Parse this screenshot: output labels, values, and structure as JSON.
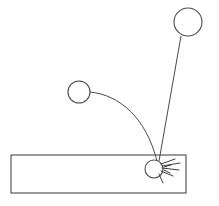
{
  "figure": {
    "background_color": "#ffffff",
    "stroke_color": "#4a4a4a",
    "width": 219,
    "height": 206
  },
  "surface": {
    "label": "surface-bar",
    "x": 11,
    "y": 155,
    "width": 175,
    "height": 38,
    "stroke_color": "#4a4a4a",
    "fill_color": "#ffffff"
  },
  "bodies": [
    {
      "id": "upper-right-circle",
      "label": "large-projectile",
      "cx": 188,
      "cy": 22,
      "r": 14,
      "stroke_color": "#4a4a4a",
      "fill_color": "#ffffff"
    },
    {
      "id": "mid-left-circle",
      "label": "small-projectile",
      "cx": 79,
      "cy": 92,
      "r": 11,
      "stroke_color": "#4a4a4a",
      "fill_color": "#ffffff"
    },
    {
      "id": "impact-circle",
      "label": "impact-body",
      "cx": 154,
      "cy": 169,
      "r": 9,
      "stroke_color": "#4a4a4a",
      "fill_color": "#ffffff"
    }
  ],
  "paths": [
    {
      "id": "curved-trajectory",
      "label": "arcing-path",
      "kind": "curve",
      "d": "M 90 92 C 120 95 146 118 157 161",
      "stroke_color": "#4a4a4a"
    },
    {
      "id": "straight-trajectory",
      "label": "steep-path",
      "kind": "line",
      "d": "M 181 36 L 159 161",
      "stroke_color": "#4a4a4a"
    }
  ],
  "splash": {
    "label": "impact-splatter",
    "origin_x": 160,
    "origin_y": 167,
    "rays": [
      "M 161 164 L 175 159",
      "M 162 166 L 180 163",
      "M 162 168 L 179 170",
      "M 161 171 L 173 176",
      "M 159 174 L 163 183",
      "M 164 167 L 171 165",
      "M 164 170 L 170 173"
    ],
    "stroke_color": "#3f3f3f"
  }
}
